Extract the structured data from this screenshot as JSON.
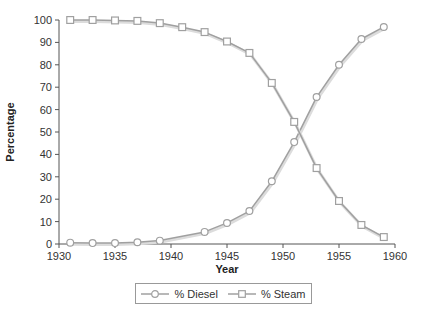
{
  "chart_data": {
    "type": "line",
    "title": "",
    "xlabel": "Year",
    "ylabel": "Percentage",
    "xlim": [
      1930,
      1960
    ],
    "ylim": [
      0,
      100
    ],
    "x_ticks": [
      1930,
      1935,
      1940,
      1945,
      1950,
      1955,
      1960
    ],
    "y_ticks": [
      0,
      10,
      20,
      30,
      40,
      50,
      60,
      70,
      80,
      90,
      100
    ],
    "grid": false,
    "legend_position": "bottom",
    "series": [
      {
        "name": "% Diesel",
        "marker": "circle",
        "color": "#a0a0a0",
        "x": [
          1931,
          1933,
          1935,
          1937,
          1939,
          1943,
          1945,
          1947,
          1949,
          1951,
          1953,
          1955,
          1957,
          1959
        ],
        "values": [
          0.6,
          0.4,
          0.4,
          0.8,
          1.5,
          5.4,
          9.4,
          14.7,
          28,
          45.5,
          65.6,
          80,
          91.5,
          96.9
        ]
      },
      {
        "name": "% Steam",
        "marker": "square",
        "color": "#a0a0a0",
        "x": [
          1931,
          1933,
          1935,
          1937,
          1939,
          1941,
          1943,
          1945,
          1947,
          1949,
          1951,
          1953,
          1955,
          1957,
          1959
        ],
        "values": [
          100,
          100,
          99.8,
          99.6,
          98.6,
          96.8,
          94.6,
          90.4,
          85.3,
          71.9,
          54.5,
          33.9,
          19.2,
          8.5,
          3.1
        ]
      }
    ]
  },
  "legend": {
    "items": [
      {
        "label": "% Diesel",
        "marker": "circle"
      },
      {
        "label": "% Steam",
        "marker": "square"
      }
    ]
  }
}
